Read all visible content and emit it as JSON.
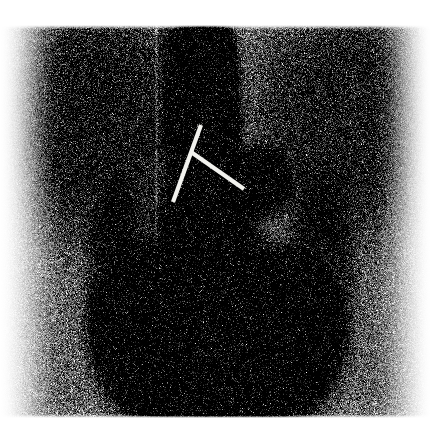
{
  "image": {
    "modality_label": "bone-scintigraphy-posterior-thorax",
    "width": 438,
    "height": 434,
    "background_color": "#ffffff",
    "colormap": "grayscale-inverted",
    "caption": ""
  },
  "scan_field": {
    "name": "acquisition-field",
    "left": 24,
    "top": 26,
    "right": 416,
    "bottom": 416,
    "edge_feather": 26,
    "noise_grain": 1.0,
    "base_gray": "#9a9a9a"
  },
  "anatomy_regions": [
    {
      "name": "soft-tissue-background",
      "shape": "rect",
      "cx": 220,
      "cy": 220,
      "rx": 190,
      "ry": 196,
      "intensity": 0.34,
      "blur": 30
    },
    {
      "name": "left-shoulder-soft-tissue",
      "shape": "ellipse",
      "cx": 95,
      "cy": 120,
      "rx": 80,
      "ry": 95,
      "intensity": 0.4,
      "blur": 34
    },
    {
      "name": "right-shoulder-soft-tissue",
      "shape": "ellipse",
      "cx": 350,
      "cy": 120,
      "rx": 78,
      "ry": 95,
      "intensity": 0.36,
      "blur": 34
    },
    {
      "name": "thoracic-spine-uptake",
      "shape": "ellipse",
      "cx": 203,
      "cy": 120,
      "rx": 34,
      "ry": 105,
      "intensity": 0.82,
      "blur": 18
    },
    {
      "name": "spine-upper-neck-uptake",
      "shape": "ellipse",
      "cx": 200,
      "cy": 45,
      "rx": 26,
      "ry": 36,
      "intensity": 0.7,
      "blur": 16
    },
    {
      "name": "rib-lesion-focal-hotspot",
      "shape": "ellipse",
      "cx": 258,
      "cy": 182,
      "rx": 24,
      "ry": 26,
      "intensity": 0.92,
      "blur": 11
    },
    {
      "name": "lumbar-spine-uptake",
      "shape": "ellipse",
      "cx": 205,
      "cy": 235,
      "rx": 40,
      "ry": 55,
      "intensity": 0.78,
      "blur": 20
    },
    {
      "name": "liver-lower-abdomen-uptake",
      "shape": "ellipse",
      "cx": 215,
      "cy": 330,
      "rx": 96,
      "ry": 78,
      "intensity": 0.95,
      "blur": 24
    },
    {
      "name": "left-kidney-uptake",
      "shape": "ellipse",
      "cx": 147,
      "cy": 318,
      "rx": 34,
      "ry": 54,
      "intensity": 0.95,
      "blur": 18
    },
    {
      "name": "right-kidney-uptake",
      "shape": "ellipse",
      "cx": 292,
      "cy": 330,
      "rx": 36,
      "ry": 58,
      "intensity": 0.88,
      "blur": 20
    },
    {
      "name": "bladder-photopenic-center",
      "shape": "ellipse",
      "cx": 216,
      "cy": 360,
      "rx": 52,
      "ry": 42,
      "intensity": -0.42,
      "blur": 22
    },
    {
      "name": "lower-pelvis-uptake",
      "shape": "ellipse",
      "cx": 218,
      "cy": 405,
      "rx": 80,
      "ry": 34,
      "intensity": 0.8,
      "blur": 20
    },
    {
      "name": "left-flank-band",
      "shape": "ellipse",
      "cx": 118,
      "cy": 300,
      "rx": 28,
      "ry": 90,
      "intensity": 0.45,
      "blur": 26
    },
    {
      "name": "right-flank-band",
      "shape": "ellipse",
      "cx": 320,
      "cy": 290,
      "rx": 30,
      "ry": 95,
      "intensity": 0.38,
      "blur": 26
    },
    {
      "name": "detector-seam-vertical-line",
      "shape": "vline",
      "cx": 156,
      "cy": 220,
      "rx": 1,
      "ry": 195,
      "intensity": -0.3,
      "blur": 2
    }
  ],
  "markers": {
    "name": "annotation-markers",
    "color": "#f2f2ee",
    "stroke_width": 4.2,
    "lines": [
      {
        "name": "marker-line-upper-left",
        "x1": 201,
        "y1": 125,
        "x2": 173,
        "y2": 202
      },
      {
        "name": "marker-line-lower-right",
        "x1": 191,
        "y1": 152,
        "x2": 244,
        "y2": 189
      }
    ]
  }
}
